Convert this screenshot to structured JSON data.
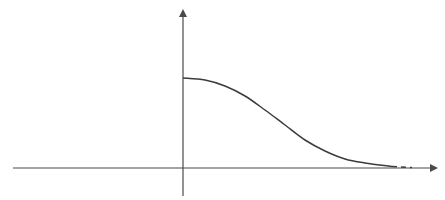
{
  "diagram": {
    "type": "function-plot",
    "colors": {
      "background": "#ffffff",
      "axis": "#4a4a4a",
      "curve": "#3c3c3c"
    },
    "x_axis": {
      "from": [
        13,
        168
      ],
      "to": [
        436,
        168
      ],
      "arrow": true
    },
    "y_axis": {
      "from": [
        183,
        196
      ],
      "to": [
        183,
        11
      ],
      "arrow": true
    },
    "curve": {
      "solid_points": [
        [
          183,
          78
        ],
        [
          205,
          80
        ],
        [
          225,
          86
        ],
        [
          245,
          96
        ],
        [
          265,
          110
        ],
        [
          285,
          125
        ],
        [
          305,
          140
        ],
        [
          325,
          151
        ],
        [
          345,
          159
        ],
        [
          365,
          163
        ],
        [
          392,
          166.5
        ]
      ],
      "dashed_segment": [
        [
          392,
          166.5
        ],
        [
          412,
          167.5
        ]
      ]
    },
    "labels": []
  }
}
